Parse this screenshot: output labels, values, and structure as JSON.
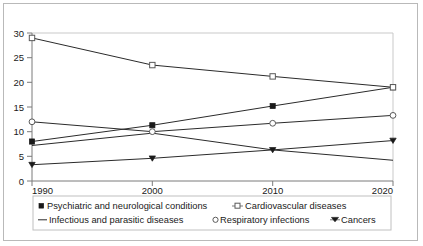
{
  "chart_data": {
    "type": "line",
    "title": "",
    "subtitle": "",
    "xlabel": "",
    "ylabel": "",
    "x": [
      1990,
      2000,
      2010,
      2020
    ],
    "xtick_labels": [
      "1990",
      "2000",
      "2010",
      "2020"
    ],
    "ytick_labels": [
      "0",
      "5",
      "10",
      "15",
      "20",
      "25",
      "30"
    ],
    "ytick_values": [
      0,
      5,
      10,
      15,
      20,
      25,
      30
    ],
    "ylim": [
      0,
      30
    ],
    "xlim": [
      1990,
      2020
    ],
    "grid": false,
    "legend_position": "bottom",
    "series": [
      {
        "name": "Psychiatric and neurological conditions",
        "marker": "filled-square",
        "values": [
          8.0,
          11.3,
          15.2,
          19.0
        ]
      },
      {
        "name": "Cardiovascular diseases",
        "marker": "open-square",
        "values": [
          29.0,
          23.5,
          21.2,
          19.0
        ]
      },
      {
        "name": "Infectious and parasitic diseases",
        "marker": "line",
        "values": [
          7.2,
          9.7,
          6.3,
          4.2
        ]
      },
      {
        "name": "Respiratory infections",
        "marker": "open-circle",
        "values": [
          12.0,
          10.0,
          11.7,
          13.3
        ]
      },
      {
        "name": "Cancers",
        "marker": "filled-triangle-down",
        "values": [
          3.3,
          4.6,
          6.3,
          8.2
        ]
      }
    ]
  },
  "legend": {
    "row1": [
      {
        "label": "Psychiatric and neurological conditions",
        "marker": "filled-square"
      },
      {
        "label": "Cardiovascular diseases",
        "marker": "open-square"
      }
    ],
    "row2": [
      {
        "label": "Infectious and parasitic diseases",
        "marker": "line"
      },
      {
        "label": "Respiratory infections",
        "marker": "open-circle"
      },
      {
        "label": "Cancers",
        "marker": "filled-triangle-down"
      }
    ]
  },
  "colors": {
    "line": "#2b2b2b",
    "marker_fill": "#1a1a1a",
    "marker_open": "#ffffff",
    "axis": "#7a7a7a",
    "frame": "#b9b9b9",
    "background": "#ffffff"
  }
}
